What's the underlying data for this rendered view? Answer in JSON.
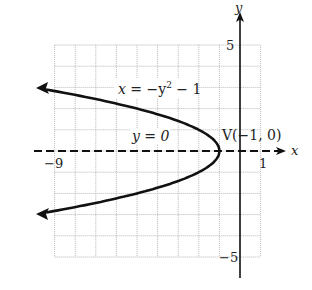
{
  "figure": {
    "equation_label": {
      "x_var": "x",
      "rest": " = −y",
      "exp": "2",
      "tail": " − 1"
    },
    "axis_label_line": "y = 0",
    "vertex_label": "V(−1, 0)",
    "x_axis_label": "x",
    "y_axis_label": "y",
    "tick_labels": {
      "x_min": "−9",
      "x_max": "1",
      "y_max": "5",
      "y_min": "−5"
    }
  },
  "chart_data": {
    "type": "line",
    "title": "",
    "curve": "x = -y^2 - 1",
    "vertex": [
      -1,
      0
    ],
    "axis_of_symmetry": "y = 0",
    "xlim": [
      -9,
      1
    ],
    "ylim": [
      -5,
      5
    ],
    "grid": true,
    "points": [
      {
        "x": -9.8,
        "y": -2.97
      },
      {
        "x": -5,
        "y": -2
      },
      {
        "x": -2,
        "y": -1
      },
      {
        "x": -1,
        "y": 0
      },
      {
        "x": -2,
        "y": 1
      },
      {
        "x": -5,
        "y": 2
      },
      {
        "x": -9.8,
        "y": 2.97
      }
    ],
    "colors": {
      "curve": "#111111",
      "grid": "#b0b0b0",
      "axes": "#111111"
    }
  }
}
